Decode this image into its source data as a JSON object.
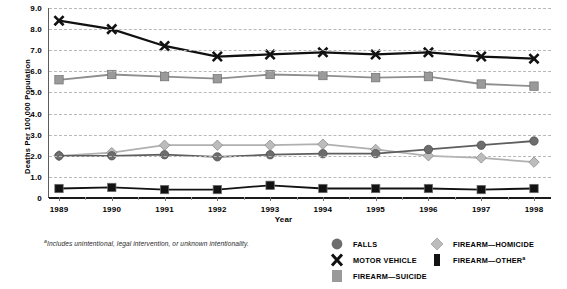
{
  "chart_data": {
    "type": "line",
    "title": "",
    "subtitle": "",
    "xlabel": "Year",
    "ylabel": "Deaths Per 100,000 Population",
    "categories": [
      "1989",
      "1990",
      "1991",
      "1992",
      "1993",
      "1994",
      "1995",
      "1996",
      "1997",
      "1998"
    ],
    "ylim": [
      0,
      9.0
    ],
    "yticks": [
      "0",
      "1.0",
      "2.0",
      "3.0",
      "4.0",
      "5.0",
      "6.0",
      "7.0",
      "8.0",
      "9.0"
    ],
    "ytick_values": [
      0,
      1.0,
      2.0,
      3.0,
      4.0,
      5.0,
      6.0,
      7.0,
      8.0,
      9.0
    ],
    "grid": true,
    "legend_position": "bottom-right",
    "series": [
      {
        "name": "FALLS",
        "marker": "circle",
        "color": "#6d6d6d",
        "line_color": "#5e5e5e",
        "values": [
          2.0,
          2.0,
          2.05,
          1.95,
          2.05,
          2.1,
          2.1,
          2.3,
          2.5,
          2.7
        ]
      },
      {
        "name": "MOTOR VEHICLE",
        "marker": "x",
        "color": "#111111",
        "line_color": "#111111",
        "values": [
          8.4,
          8.0,
          7.2,
          6.7,
          6.8,
          6.9,
          6.8,
          6.9,
          6.7,
          6.6
        ]
      },
      {
        "name": "FIREARM—SUICIDE",
        "marker": "square",
        "color": "#9a9a9a",
        "line_color": "#8e8e8e",
        "values": [
          5.6,
          5.85,
          5.75,
          5.65,
          5.85,
          5.8,
          5.7,
          5.75,
          5.4,
          5.3
        ]
      },
      {
        "name": "FIREARM—HOMICIDE",
        "marker": "diamond",
        "color": "#bcbcbc",
        "line_color": "#b0b0b0",
        "values": [
          2.0,
          2.15,
          2.5,
          2.5,
          2.5,
          2.55,
          2.3,
          2.0,
          1.9,
          1.7
        ]
      },
      {
        "name": "FIREARM—OTHER",
        "name_suffix": "a",
        "marker": "square",
        "color": "#121212",
        "line_color": "#121212",
        "values": [
          0.45,
          0.5,
          0.4,
          0.4,
          0.6,
          0.45,
          0.45,
          0.45,
          0.4,
          0.45
        ]
      }
    ]
  },
  "footnote": {
    "marker": "a",
    "text": "Includes unintentional, legal intervention, or unknown intentionality."
  },
  "legend": {
    "items": [
      {
        "label": "FALLS",
        "suffix": "",
        "icon": "circle-marker-icon"
      },
      {
        "label": "MOTOR VEHICLE",
        "suffix": "",
        "icon": "x-marker-icon"
      },
      {
        "label": "FIREARM—SUICIDE",
        "suffix": "",
        "icon": "square-marker-icon"
      },
      {
        "label": "FIREARM—HOMICIDE",
        "suffix": "",
        "icon": "diamond-marker-icon"
      },
      {
        "label": "FIREARM—OTHER",
        "suffix": "a",
        "icon": "square-dark-marker-icon"
      }
    ]
  }
}
